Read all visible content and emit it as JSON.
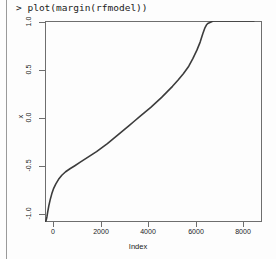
{
  "console": {
    "prompt_line": "> plot(margin(rfmodel))"
  },
  "chart_data": {
    "type": "line",
    "title": "",
    "xlabel": "Index",
    "ylabel": "x",
    "xlim": [
      0,
      8000
    ],
    "ylim": [
      -1.0,
      1.0
    ],
    "grid": false,
    "legend": null,
    "xticks": [
      "0",
      "2000",
      "4000",
      "6000",
      "8000"
    ],
    "xtick_values": [
      0,
      2000,
      4000,
      6000,
      8000
    ],
    "yticks": [
      "1.0",
      "0.5",
      "0.0",
      "-0.5",
      "-1.0"
    ],
    "ytick_values": [
      1.0,
      0.5,
      0.0,
      -0.5,
      -1.0
    ],
    "series_name": "margin",
    "point_color": "#3c3c3c",
    "x": [
      10,
      40,
      70,
      100,
      140,
      190,
      250,
      320,
      400,
      500,
      620,
      760,
      920,
      1100,
      1300,
      1500,
      1700,
      1900,
      2100,
      2300,
      2500,
      2700,
      2900,
      3100,
      3300,
      3500,
      3700,
      3900,
      4100,
      4300,
      4500,
      4700,
      4900,
      5100,
      5300,
      5450,
      5600,
      5720,
      5820,
      5900,
      5950,
      6000,
      6200,
      6600,
      7000,
      7400,
      7700
    ],
    "y": [
      -1.0,
      -0.985,
      -0.95,
      -0.9,
      -0.84,
      -0.78,
      -0.72,
      -0.665,
      -0.62,
      -0.575,
      -0.535,
      -0.5,
      -0.47,
      -0.44,
      -0.405,
      -0.37,
      -0.335,
      -0.3,
      -0.26,
      -0.22,
      -0.175,
      -0.13,
      -0.085,
      -0.04,
      0.005,
      0.05,
      0.095,
      0.14,
      0.19,
      0.24,
      0.295,
      0.35,
      0.41,
      0.475,
      0.55,
      0.625,
      0.71,
      0.79,
      0.875,
      0.935,
      0.96,
      0.975,
      1.0,
      1.0,
      1.0,
      1.0,
      1.0
    ]
  }
}
